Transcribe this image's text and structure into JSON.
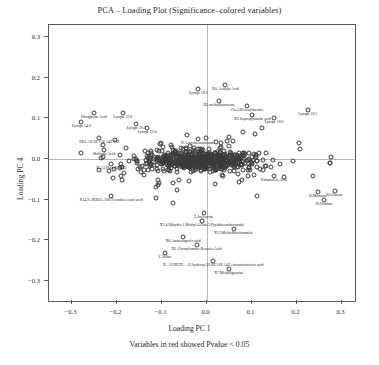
{
  "chart_data": {
    "type": "scatter",
    "title": "PCA – Loading Plot (Significance–colored variables)",
    "xlabel": "Loading PC 1",
    "ylabel": "Loading PC 4",
    "caption": "Variables in red showed Pvalue < 0.05",
    "xlim": [
      -0.35,
      0.33
    ],
    "ylim": [
      -0.35,
      0.33
    ],
    "xticks": [
      "−0.3",
      "−0.2",
      "−0.1",
      "0.0",
      "0.1",
      "0.2",
      "0.3"
    ],
    "xtickvals": [
      -0.3,
      -0.2,
      -0.1,
      0.0,
      0.1,
      0.2,
      0.3
    ],
    "yticks": [
      "0.3",
      "0.2",
      "0.1",
      "0.0",
      "−0.1",
      "−0.2",
      "−0.3"
    ],
    "ytickvals": [
      0.3,
      0.2,
      0.1,
      0.0,
      -0.1,
      -0.2,
      -0.3
    ],
    "grid": false,
    "legend": "none",
    "point_marker": "open-circle",
    "colors": {
      "significant": "#d01f1f",
      "default": "#1d1d1d",
      "axis": "#5a5a5a",
      "zeroline": "#b9b9b9"
    },
    "labeled_points": [
      {
        "label": "X0. Aenylic Acid",
        "x": 0.042,
        "y": 0.182,
        "significant": false
      },
      {
        "label": "Lysopc 18.1",
        "x": -0.018,
        "y": 0.172,
        "significant": false
      },
      {
        "label": "X2.methylbutanoate",
        "x": 0.028,
        "y": 0.143,
        "significant": false
      },
      {
        "label": "Cis.3.Hexenylacetate",
        "x": 0.09,
        "y": 0.13,
        "significant": false
      },
      {
        "label": "Lysopc 18.1",
        "x": 0.225,
        "y": 0.12,
        "significant": false
      },
      {
        "label": "X2.Isopropylmalic acid",
        "x": 0.102,
        "y": 0.108,
        "significant": false
      },
      {
        "label": "Lysopc 18.0",
        "x": 0.15,
        "y": 0.1,
        "significant": false
      },
      {
        "label": "Phosphoric Acid",
        "x": -0.25,
        "y": 0.112,
        "significant": false
      },
      {
        "label": "Lysopc 15.0",
        "x": -0.186,
        "y": 0.112,
        "significant": false
      },
      {
        "label": "Lysopc 14.0",
        "x": -0.278,
        "y": 0.092,
        "significant": false
      },
      {
        "label": "Lysopc 20.3",
        "x": -0.156,
        "y": 0.086,
        "significant": false
      },
      {
        "label": "Lysopc 22.6",
        "x": -0.132,
        "y": 0.076,
        "significant": false
      },
      {
        "label": "EPA. 5Z 8Z 11Z 14Z 17Z",
        "x": -0.238,
        "y": 0.052,
        "significant": false
      },
      {
        "label": "N.Acetylneuraminate",
        "x": -0.02,
        "y": 0.048,
        "significant": false
      },
      {
        "label": "Shikimic Acid",
        "x": -0.228,
        "y": 0.022,
        "significant": false
      },
      {
        "label": "X..12.Phenyl.HHQ",
        "x": -0.212,
        "y": -0.012,
        "significant": false
      },
      {
        "label": "Uracil",
        "x": 0.09,
        "y": -0.004,
        "significant": false
      },
      {
        "label": "Palmitoleic Acid",
        "x": 0.15,
        "y": -0.042,
        "significant": false
      },
      {
        "label": "X14.9..HOHA..10E.9.oxodec.enoic acid",
        "x": -0.212,
        "y": -0.092,
        "significant": false
      },
      {
        "label": "D.Mannose",
        "x": 0.248,
        "y": -0.082,
        "significant": false
      },
      {
        "label": "D.Glucose",
        "x": 0.285,
        "y": -0.08,
        "significant": false
      },
      {
        "label": "D.Fructose",
        "x": 0.262,
        "y": -0.102,
        "significant": false
      },
      {
        "label": "L.Isoleucine",
        "x": -0.006,
        "y": -0.132,
        "significant": false
      },
      {
        "label": "X1.4.Dihydro.1.Methyl.4.Oxo.3.Pyridinecarboxamide",
        "x": -0.01,
        "y": -0.152,
        "significant": false
      },
      {
        "label": "X12.Methylnicotinamide",
        "x": 0.06,
        "y": -0.172,
        "significant": false
      },
      {
        "label": "X6.Aminocaproic acid",
        "x": -0.052,
        "y": -0.192,
        "significant": false
      },
      {
        "label": "X2..Formylamino.Benzoic.Acid",
        "x": -0.022,
        "y": -0.212,
        "significant": false
      },
      {
        "label": "L.Valine",
        "x": -0.092,
        "y": -0.232,
        "significant": false
      },
      {
        "label": "X...12.HETE....12.hydroxy.5Z.8Z.10E.14Z.eicosatetraenoic.acid",
        "x": 0.015,
        "y": -0.252,
        "significant": false
      },
      {
        "label": "X7.Methylguanine",
        "x": 0.05,
        "y": -0.272,
        "significant": false
      }
    ],
    "cloud": {
      "n": 520,
      "center": [
        -0.01,
        -0.005
      ],
      "spread_x": 0.105,
      "spread_y": 0.022,
      "note": "dense band of unlabeled loading points along PC4 ≈ 0"
    }
  }
}
